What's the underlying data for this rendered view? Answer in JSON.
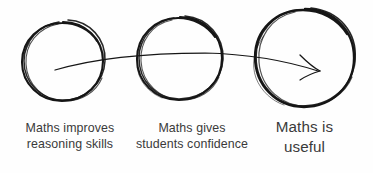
{
  "figure": {
    "background_color": "#fefefe",
    "ink_color": "#1a1a1a",
    "text_color": "#3a3a3a"
  },
  "steps": [
    {
      "id": "step-1",
      "shape": "hand-drawn-circle",
      "line_1": "Maths improves",
      "line_2": "reasoning skills"
    },
    {
      "id": "step-2",
      "shape": "hand-drawn-circle",
      "line_1": "Maths gives",
      "line_2": "students confidence"
    },
    {
      "id": "step-3",
      "shape": "hand-drawn-circle",
      "line_1": "Maths is",
      "line_2": "useful"
    }
  ],
  "arrow": {
    "name": "progression-arrow",
    "direction": "left-to-right",
    "style": "hand-drawn"
  }
}
